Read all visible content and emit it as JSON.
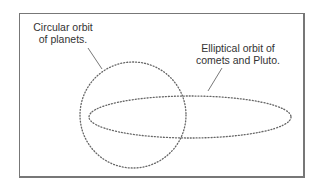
{
  "diagram": {
    "labels": {
      "circular": [
        "Circular orbit",
        "of planets."
      ],
      "elliptical": [
        "Elliptical orbit of",
        "comets and Pluto."
      ]
    },
    "shapes": {
      "circle": {
        "name": "circular-orbit",
        "cx": 133,
        "cy": 115,
        "r": 53,
        "style": "dotted"
      },
      "ellipse": {
        "name": "elliptical-orbit",
        "cx": 190,
        "cy": 117,
        "rx": 101,
        "ry": 21,
        "style": "dotted"
      }
    },
    "colors": {
      "line": "#666666",
      "frame": "#777777",
      "text": "#333333"
    }
  }
}
